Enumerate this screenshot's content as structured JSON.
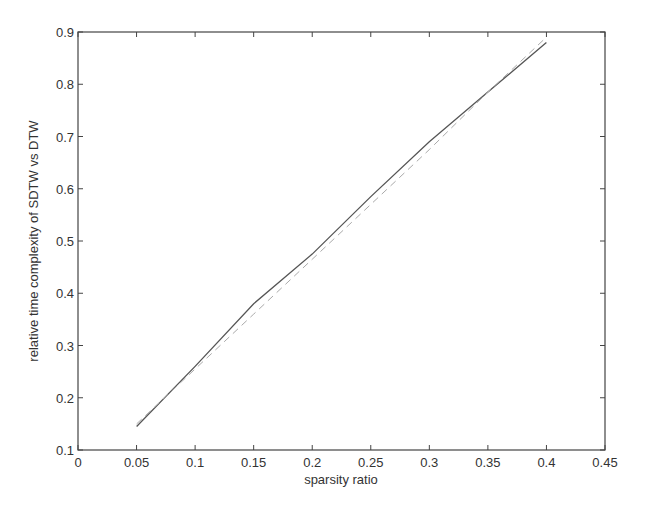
{
  "chart_data": {
    "type": "line",
    "title": "",
    "xlabel": "sparsity ratio",
    "ylabel": "relative time complexity of SDTW vs DTW",
    "xlim": [
      0,
      0.45
    ],
    "ylim": [
      0.1,
      0.9
    ],
    "grid": false,
    "legend": null,
    "x_ticks": [
      "0",
      "0.05",
      "0.1",
      "0.15",
      "0.2",
      "0.25",
      "0.3",
      "0.35",
      "0.4",
      "0.45"
    ],
    "y_ticks": [
      "0.1",
      "0.2",
      "0.3",
      "0.4",
      "0.5",
      "0.6",
      "0.7",
      "0.8",
      "0.9"
    ],
    "x": [
      0.05,
      0.1,
      0.15,
      0.2,
      0.25,
      0.3,
      0.35,
      0.4
    ],
    "series": [
      {
        "name": "measured",
        "style": "solid",
        "color": "#555555",
        "values": [
          0.145,
          0.26,
          0.38,
          0.475,
          0.585,
          0.69,
          0.785,
          0.88
        ]
      },
      {
        "name": "reference",
        "style": "dashed",
        "color": "#aaaaaa",
        "values": [
          0.15,
          0.255,
          0.36,
          0.465,
          0.57,
          0.675,
          0.785,
          0.89
        ]
      }
    ]
  },
  "axes": {
    "x_label": "sparsity ratio",
    "y_label": "relative time complexity of SDTW vs DTW"
  }
}
